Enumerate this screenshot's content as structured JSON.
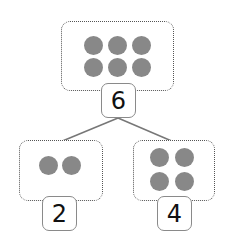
{
  "diagram": {
    "type": "number-bond",
    "whole": {
      "value": "6",
      "dots": 6
    },
    "parts": [
      {
        "value": "2",
        "dots": 2
      },
      {
        "value": "4",
        "dots": 4
      }
    ],
    "colors": {
      "dot": "#888888",
      "border": "#555555",
      "line": "#777777"
    }
  }
}
